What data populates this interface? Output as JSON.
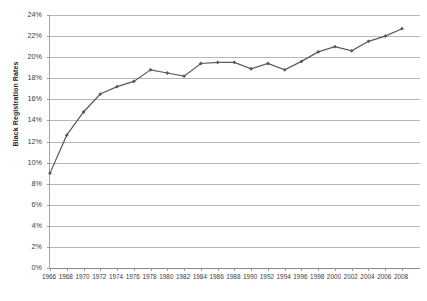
{
  "chart_data": {
    "type": "line",
    "title": "",
    "xlabel": "",
    "ylabel": "Black Registration Rates",
    "ylim": [
      0,
      24
    ],
    "ytick_labels": [
      "24%",
      "22%",
      "20%",
      "18%",
      "16%",
      "14%",
      "12%",
      "10%",
      "8%",
      "6%",
      "4%",
      "2%",
      "0%"
    ],
    "ytick_values": [
      24,
      22,
      20,
      18,
      16,
      14,
      12,
      10,
      8,
      6,
      4,
      2,
      0
    ],
    "grid": true,
    "legend": "none",
    "marker": "diamond",
    "line_color": "#595959",
    "categories": [
      "1966",
      "1968",
      "1970",
      "1972",
      "1974",
      "1976",
      "1978",
      "1980",
      "1982",
      "1984",
      "1986",
      "1988",
      "1990",
      "1992",
      "1994",
      "1996",
      "1998",
      "2000",
      "2002",
      "2004",
      "2006",
      "2008"
    ],
    "x": [
      1966,
      1968,
      1970,
      1972,
      1974,
      1976,
      1978,
      1980,
      1982,
      1984,
      1986,
      1988,
      1990,
      1992,
      1994,
      1996,
      1998,
      2000,
      2002,
      2004,
      2006,
      2008
    ],
    "values": [
      9.0,
      12.6,
      14.8,
      16.5,
      17.2,
      17.7,
      18.8,
      18.5,
      18.2,
      19.4,
      19.5,
      19.5,
      18.9,
      19.4,
      18.8,
      19.6,
      20.5,
      21.0,
      20.6,
      21.5,
      22.0,
      22.7
    ]
  },
  "axes": {
    "y_title": "Black Registration Rates"
  }
}
